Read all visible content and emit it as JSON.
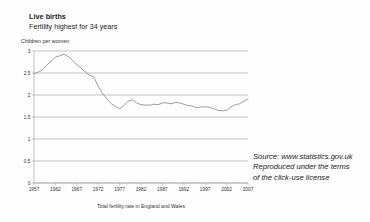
{
  "chart_data": {
    "type": "line",
    "title": "Live births",
    "subtitle": "Fertility highest for 34 years",
    "ylabel": "Children per women",
    "xlabel": "Total fertility rate in England and Wales",
    "grid": true,
    "legend": "none",
    "xlim": [
      1957,
      2007
    ],
    "ylim": [
      0,
      3
    ],
    "ytick_labels": [
      "3",
      "2.5",
      "2",
      "1.5",
      "1",
      "0.5",
      "0"
    ],
    "ytick_values": [
      3,
      2.5,
      2,
      1.5,
      1,
      0.5,
      0
    ],
    "xtick_labels": [
      "1957",
      "1962",
      "1967",
      "1972",
      "1977",
      "1982",
      "1987",
      "1992",
      "1997",
      "2002",
      "2007"
    ],
    "xtick_values": [
      1957,
      1962,
      1967,
      1972,
      1977,
      1982,
      1987,
      1992,
      1997,
      2002,
      2007
    ],
    "series": [
      {
        "name": "Total fertility rate",
        "x": [
          1957,
          1958,
          1959,
          1960,
          1961,
          1962,
          1963,
          1964,
          1965,
          1966,
          1967,
          1968,
          1969,
          1970,
          1971,
          1972,
          1973,
          1974,
          1975,
          1976,
          1977,
          1978,
          1979,
          1980,
          1981,
          1982,
          1983,
          1984,
          1985,
          1986,
          1987,
          1988,
          1989,
          1990,
          1991,
          1992,
          1993,
          1994,
          1995,
          1996,
          1997,
          1998,
          1999,
          2000,
          2001,
          2002,
          2003,
          2004,
          2005,
          2006,
          2007
        ],
        "values": [
          2.48,
          2.52,
          2.58,
          2.68,
          2.77,
          2.86,
          2.89,
          2.93,
          2.87,
          2.79,
          2.69,
          2.61,
          2.52,
          2.45,
          2.41,
          2.2,
          2.04,
          1.92,
          1.81,
          1.74,
          1.69,
          1.76,
          1.86,
          1.89,
          1.82,
          1.78,
          1.77,
          1.77,
          1.79,
          1.78,
          1.82,
          1.82,
          1.8,
          1.83,
          1.82,
          1.79,
          1.76,
          1.75,
          1.71,
          1.73,
          1.73,
          1.72,
          1.69,
          1.65,
          1.64,
          1.65,
          1.73,
          1.78,
          1.8,
          1.86,
          1.91
        ]
      }
    ]
  },
  "source_note": {
    "line1": "Source: www.statistics.gov.uk",
    "line2": "Reproduced under the terms",
    "line3": "of the click-use license"
  },
  "colors": {
    "background": "#fdfdfd",
    "line": "#8d8d8d",
    "grid": "#8a8a8a",
    "text": "#1a1a1a"
  }
}
